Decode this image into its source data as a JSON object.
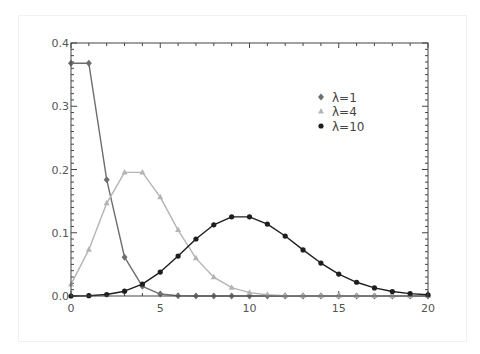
{
  "chart_data": {
    "type": "line",
    "title": "",
    "xlabel": "",
    "ylabel": "",
    "xlim": [
      0,
      20
    ],
    "ylim": [
      0,
      0.4
    ],
    "grid": false,
    "legend_position": "upper right (inside plot)",
    "x": [
      0,
      1,
      2,
      3,
      4,
      5,
      6,
      7,
      8,
      9,
      10,
      11,
      12,
      13,
      14,
      15,
      16,
      17,
      18,
      19,
      20
    ],
    "x_ticks": [
      "0",
      "5",
      "10",
      "15",
      "20"
    ],
    "y_ticks": [
      "0.0",
      "0.1",
      "0.2",
      "0.3",
      "0.4"
    ],
    "series": [
      {
        "name": "λ=1",
        "marker": "diamond",
        "color": "#6e6e6e",
        "values": [
          0.3679,
          0.3679,
          0.1839,
          0.0613,
          0.0153,
          0.0031,
          0.0005,
          0.0001,
          0,
          0,
          0,
          0,
          0,
          0,
          0,
          0,
          0,
          0,
          0,
          0,
          0
        ]
      },
      {
        "name": "λ=4",
        "marker": "triangle",
        "color": "#b4b4b4",
        "values": [
          0.0183,
          0.0733,
          0.1465,
          0.1954,
          0.1954,
          0.1563,
          0.1042,
          0.0595,
          0.0298,
          0.0132,
          0.0053,
          0.0019,
          0.0006,
          0.0002,
          0.0001,
          0,
          0,
          0,
          0,
          0,
          0
        ]
      },
      {
        "name": "λ=10",
        "marker": "circle",
        "color": "#1e1e1e",
        "values": [
          0.0,
          0.0005,
          0.0023,
          0.0076,
          0.0189,
          0.0378,
          0.0631,
          0.0901,
          0.1126,
          0.1251,
          0.1251,
          0.1137,
          0.0948,
          0.0729,
          0.0521,
          0.0347,
          0.0217,
          0.0128,
          0.0071,
          0.0037,
          0.0019
        ]
      }
    ]
  },
  "legend": {
    "items": [
      {
        "label": "λ=1"
      },
      {
        "label": "λ=4"
      },
      {
        "label": "λ=10"
      }
    ]
  }
}
